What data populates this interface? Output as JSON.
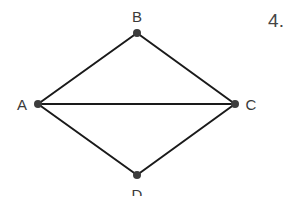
{
  "problem_number": "4.",
  "graph": {
    "nodes": [
      {
        "id": "A",
        "label": "A",
        "x": 38,
        "y": 104,
        "label_x": 22,
        "label_y": 104
      },
      {
        "id": "B",
        "label": "B",
        "x": 137,
        "y": 33,
        "label_x": 137,
        "label_y": 16
      },
      {
        "id": "C",
        "label": "C",
        "x": 235,
        "y": 104,
        "label_x": 251,
        "label_y": 104
      },
      {
        "id": "D",
        "label": "D",
        "x": 137,
        "y": 175,
        "label_x": 137,
        "label_y": 194
      }
    ],
    "edges": [
      {
        "from": "A",
        "to": "B"
      },
      {
        "from": "B",
        "to": "C"
      },
      {
        "from": "A",
        "to": "C"
      },
      {
        "from": "A",
        "to": "D"
      },
      {
        "from": "D",
        "to": "C"
      }
    ],
    "colors": {
      "edge": "#1a1a1a",
      "node": "#3c3c3c",
      "label": "#3a3a3a"
    }
  }
}
